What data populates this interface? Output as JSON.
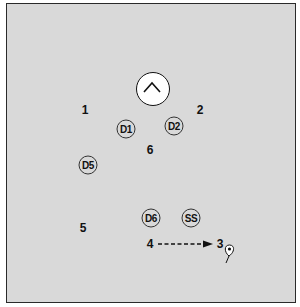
{
  "diagram": {
    "title": "",
    "background_color": "#d9d9d9",
    "frame_color": "#2a2a2a",
    "center_player": {
      "symbol": "caret-up-icon",
      "label": "^"
    },
    "positions": [
      {
        "id": "p1",
        "label": "1",
        "x": 85,
        "y": 110
      },
      {
        "id": "p2",
        "label": "2",
        "x": 200,
        "y": 110
      },
      {
        "id": "p3",
        "label": "3",
        "x": 220,
        "y": 244
      },
      {
        "id": "p4",
        "label": "4",
        "x": 150,
        "y": 244
      },
      {
        "id": "p5",
        "label": "5",
        "x": 83,
        "y": 228
      },
      {
        "id": "p6",
        "label": "6",
        "x": 150,
        "y": 150
      }
    ],
    "defenders": [
      {
        "id": "d1",
        "label": "D1",
        "x": 126,
        "y": 129
      },
      {
        "id": "d2",
        "label": "D2",
        "x": 174,
        "y": 126
      },
      {
        "id": "d5",
        "label": "D5",
        "x": 88,
        "y": 165
      },
      {
        "id": "d6",
        "label": "D6",
        "x": 151,
        "y": 218
      },
      {
        "id": "ss",
        "label": "SS",
        "x": 191,
        "y": 218
      }
    ],
    "movement": {
      "from": "4",
      "to": "3",
      "style": "dashed-arrow"
    },
    "marker": {
      "icon": "ball-marker-icon",
      "near": "3"
    }
  }
}
